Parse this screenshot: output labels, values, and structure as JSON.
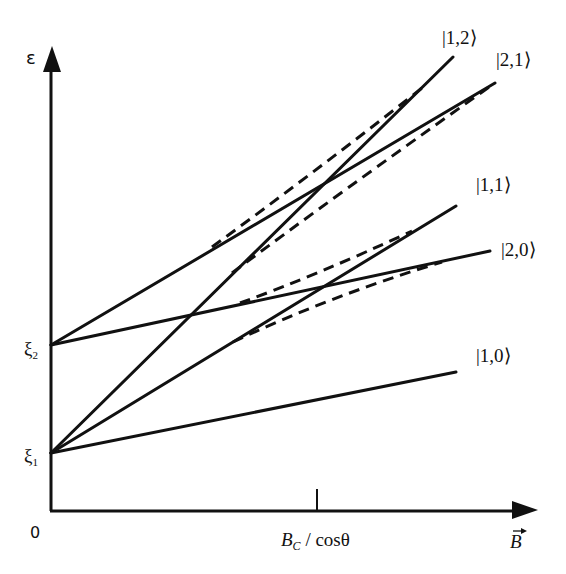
{
  "axes": {
    "y_label": "ε",
    "x_label": "B⃗",
    "origin_label": "0",
    "x_tick_label": "B_c / cosθ",
    "x_tick_label_main": "B",
    "x_tick_label_sub": "C",
    "x_tick_label_rest": " / cosθ",
    "y_tick_labels": [
      {
        "main": "ξ",
        "sub": "1"
      },
      {
        "main": "ξ",
        "sub": "2"
      }
    ]
  },
  "levels": [
    {
      "label": "|1,0⟩",
      "start": "ξ1",
      "style": "solid"
    },
    {
      "label": "|1,1⟩",
      "start": "ξ1",
      "style": "solid"
    },
    {
      "label": "|1,2⟩",
      "start": "ξ1",
      "style": "solid"
    },
    {
      "label": "|2,0⟩",
      "start": "ξ2",
      "style": "solid"
    },
    {
      "label": "|2,1⟩",
      "start": "ξ2",
      "style": "solid"
    }
  ],
  "avoided_crossings": [
    {
      "between": [
        "|1,1⟩",
        "|2,0⟩"
      ],
      "at": "B_c / cosθ",
      "style": "dashed"
    },
    {
      "between": [
        "|1,2⟩",
        "|2,1⟩"
      ],
      "at": "B_c / cosθ",
      "style": "dashed"
    }
  ],
  "colors": {
    "line": "#111111",
    "background": "#ffffff"
  }
}
